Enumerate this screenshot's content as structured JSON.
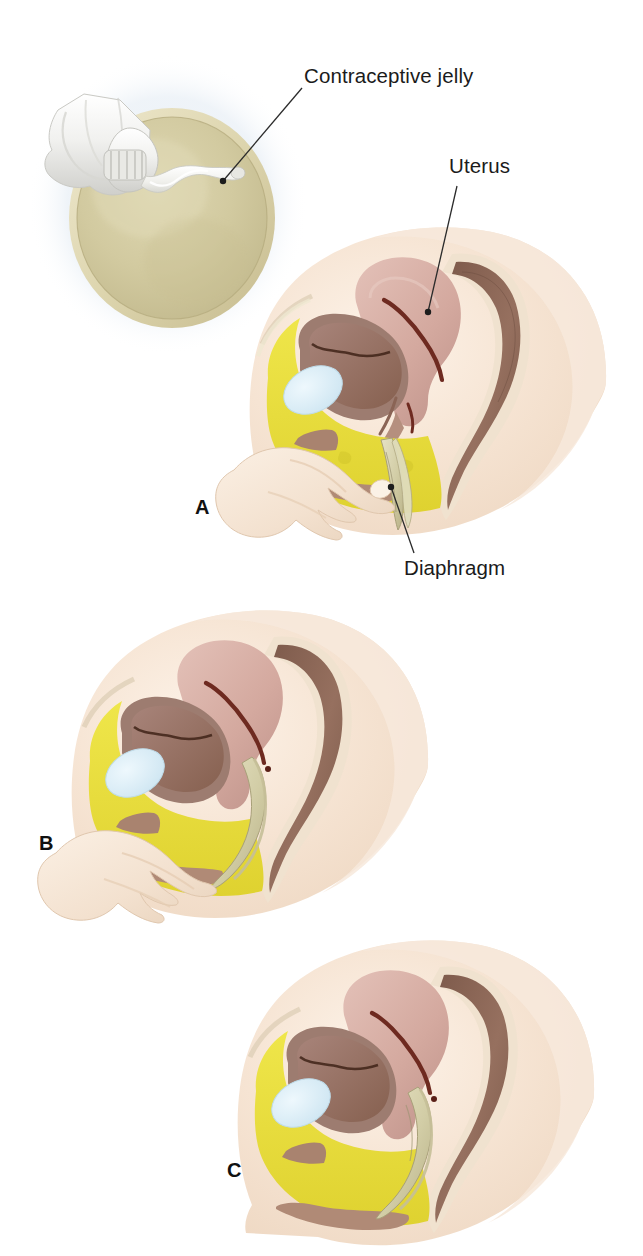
{
  "figure": {
    "background_color": "#ffffff",
    "width": 643,
    "height": 1256,
    "type": "medical-illustration"
  },
  "labels": {
    "contraceptive_jelly": "Contraceptive jelly",
    "uterus": "Uterus",
    "diaphragm": "Diaphragm"
  },
  "leaders": {
    "contraceptive_jelly": {
      "text_anchor_x": 302,
      "text_anchor_y": 88,
      "point_x": 223,
      "point_y": 181,
      "color": "#2b2b2b"
    },
    "uterus": {
      "text_anchor_x": 457,
      "text_anchor_y": 186,
      "point_x": 428,
      "point_y": 312,
      "color": "#2b2b2b"
    },
    "diaphragm": {
      "text_anchor_x": 414,
      "text_anchor_y": 553,
      "point_x": 391,
      "point_y": 487,
      "color": "#2b2b2b"
    }
  },
  "panels": [
    {
      "id": "A",
      "letter": "A",
      "caption_role": "apply-jelly-and-begin-insertion",
      "description": "Diaphragm dome with contraceptive jelly being applied from a tube, plus pelvic cross-section with hand folding and starting to insert the diaphragm"
    },
    {
      "id": "B",
      "letter": "B",
      "caption_role": "advance-diaphragm",
      "description": "Pelvic cross-section with fingers pushing the folded diaphragm up along the vaginal canal"
    },
    {
      "id": "C",
      "letter": "C",
      "caption_role": "diaphragm-in-place",
      "description": "Pelvic cross-section showing the diaphragm seated over the cervix with hand withdrawn"
    }
  ],
  "anatomy_legend": [
    {
      "name": "uterus",
      "color": "#d4a99f"
    },
    {
      "name": "uterine-cavity",
      "color": "#6e2a20"
    },
    {
      "name": "bladder",
      "color": "#8f6a5c"
    },
    {
      "name": "bladder-lumen",
      "color": "#5e3428"
    },
    {
      "name": "pubic-bone",
      "color": "#d7ecf5"
    },
    {
      "name": "fat-tissue",
      "color": "#e8df3c"
    },
    {
      "name": "rectum",
      "color": "#9a7a6c"
    },
    {
      "name": "rectum-lumen",
      "color": "#6f4f44"
    },
    {
      "name": "skin",
      "color": "#f6e6d8"
    },
    {
      "name": "diaphragm-device",
      "color": "#d5d3b6"
    },
    {
      "name": "jelly",
      "color": "#f2f2ee"
    },
    {
      "name": "diaphragm-dome",
      "color": "#cfc8a0"
    },
    {
      "name": "tube",
      "color": "#ededeb"
    },
    {
      "name": "halo",
      "color": "#eef3f7"
    }
  ],
  "colors": {
    "background": "#ffffff",
    "label_text": "#1b1b1b",
    "leader_line": "#2b2b2b",
    "panel_letter": "#111111"
  }
}
